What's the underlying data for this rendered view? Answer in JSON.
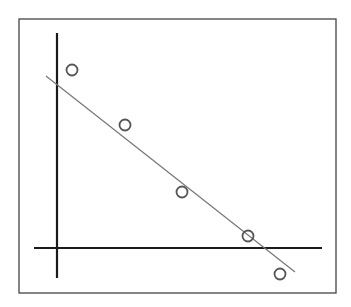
{
  "chart_data": {
    "type": "scatter",
    "title": "",
    "xlabel": "",
    "ylabel": "",
    "grid": false,
    "legend": null,
    "trendline": {
      "kind": "linear-fit",
      "color": "#777777",
      "from_px": [
        46,
        76
      ],
      "to_px": [
        295,
        272
      ]
    },
    "frame_px": {
      "x": 19,
      "y": 19,
      "width": 317,
      "height": 274
    },
    "axes_px": {
      "x_axis": {
        "y": 248,
        "x1": 34,
        "x2": 322
      },
      "y_axis": {
        "x": 57,
        "y1": 33,
        "y2": 278
      }
    },
    "points_px": [
      {
        "x": 72,
        "y": 70
      },
      {
        "x": 125,
        "y": 125
      },
      {
        "x": 182,
        "y": 192
      },
      {
        "x": 248,
        "y": 236
      },
      {
        "x": 280,
        "y": 274
      }
    ],
    "x": [
      0.5,
      2.2,
      4.0,
      6.1,
      7.1
    ],
    "y": [
      5.7,
      4.0,
      1.8,
      0.4,
      -0.8
    ],
    "colors": {
      "axis": "#1a1a1a",
      "frame": "#444444",
      "marker": "#555555",
      "trendline": "#777777",
      "background": "#ffffff"
    }
  }
}
